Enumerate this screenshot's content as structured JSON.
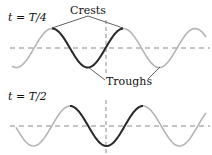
{
  "panels": [
    {
      "time_label": "t = T/4",
      "axis_y": 48,
      "amplitude": 19.5,
      "wavelength": 71.5,
      "crests_x": [
        52,
        123
      ],
      "troughs_x": [
        88,
        160
      ],
      "highlight_x": [
        52,
        123
      ],
      "vertical_x": 106
    },
    {
      "time_label": "t = T/2",
      "axis_y": 126,
      "amplitude": 20,
      "wavelength": 73,
      "crests_x": [
        70,
        143
      ],
      "troughs_x": [
        107
      ],
      "highlight_x": [
        70,
        143
      ],
      "vertical_x": 106
    }
  ],
  "annotations": {
    "crests_label": "Crests",
    "troughs_label": "Troughs"
  },
  "colors": {
    "wave_light": "#b4b4b4",
    "wave_dark": "#2a2a2a",
    "axis": "#8a8a8a",
    "text": "#111111"
  }
}
